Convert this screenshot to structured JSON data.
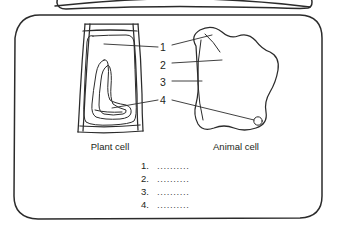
{
  "page": {
    "background_color": "#ffffff",
    "ink_color": "#2b2b2b"
  },
  "frames": {
    "top_partial_panel": "partial rounded rectangle cropped at top edge",
    "main_panel": "rounded rectangle containing the two cell diagrams"
  },
  "diagrams": [
    {
      "id": "plant-cell",
      "caption": "Plant cell",
      "parts": [
        "cell wall",
        "cell membrane",
        "cytoplasm",
        "vacuole"
      ]
    },
    {
      "id": "animal-cell",
      "caption": "Animal cell",
      "parts": [
        "nucleus",
        "cytoplasm",
        "cell membrane",
        "centriole"
      ]
    }
  ],
  "callouts": [
    {
      "number": "1"
    },
    {
      "number": "2"
    },
    {
      "number": "3"
    },
    {
      "number": "4"
    }
  ],
  "captions": {
    "plant": "Plant cell",
    "animal": "Animal cell"
  },
  "answer_list": [
    {
      "number": "1.",
      "blank": ".........."
    },
    {
      "number": "2.",
      "blank": ".........."
    },
    {
      "number": "3.",
      "blank": ".........."
    },
    {
      "number": "4.",
      "blank": ".........."
    }
  ]
}
